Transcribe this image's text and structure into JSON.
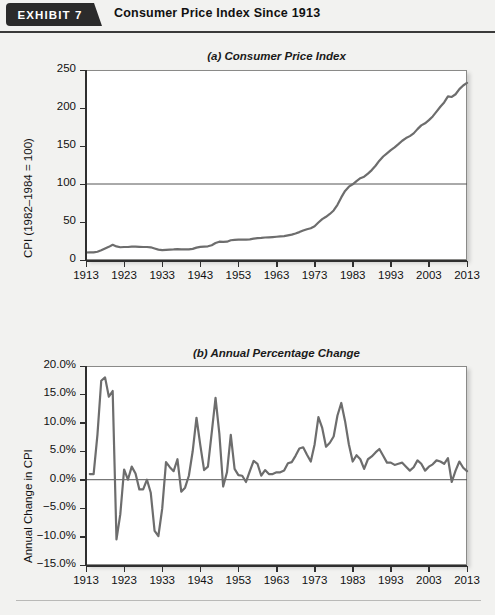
{
  "header": {
    "exhibit_tag": "EXHIBIT 7",
    "title": "Consumer Price Index Since 1913"
  },
  "chart_data": [
    {
      "type": "line",
      "panel_id": "a",
      "title": "(a) Consumer Price Index",
      "xlabel": "",
      "ylabel": "CPI (1982–1984 = 100)",
      "xlim": [
        1913,
        2013
      ],
      "ylim": [
        0,
        250
      ],
      "yticks": [
        0,
        50,
        100,
        150,
        200,
        250
      ],
      "ytick_labels": [
        "0",
        "50",
        "100",
        "150",
        "200",
        "250"
      ],
      "xticks": [
        1913,
        1923,
        1933,
        1943,
        1953,
        1963,
        1973,
        1983,
        1993,
        2003,
        2013
      ],
      "xtick_labels": [
        "1913",
        "1923",
        "1933",
        "1943",
        "1953",
        "1963",
        "1973",
        "1983",
        "1993",
        "2003",
        "2013"
      ],
      "grid": false,
      "reference_lines": [
        {
          "y": 100,
          "label": "100"
        }
      ],
      "legend": "none",
      "series": [
        {
          "name": "Consumer Price Index",
          "color": "#6d6d6d",
          "x": [
            1913,
            1914,
            1915,
            1916,
            1917,
            1918,
            1919,
            1920,
            1921,
            1922,
            1923,
            1924,
            1925,
            1926,
            1927,
            1928,
            1929,
            1930,
            1931,
            1932,
            1933,
            1934,
            1935,
            1936,
            1937,
            1938,
            1939,
            1940,
            1941,
            1942,
            1943,
            1944,
            1945,
            1946,
            1947,
            1948,
            1949,
            1950,
            1951,
            1952,
            1953,
            1954,
            1955,
            1956,
            1957,
            1958,
            1959,
            1960,
            1961,
            1962,
            1963,
            1964,
            1965,
            1966,
            1967,
            1968,
            1969,
            1970,
            1971,
            1972,
            1973,
            1974,
            1975,
            1976,
            1977,
            1978,
            1979,
            1980,
            1981,
            1982,
            1983,
            1984,
            1985,
            1986,
            1987,
            1988,
            1989,
            1990,
            1991,
            1992,
            1993,
            1994,
            1995,
            1996,
            1997,
            1998,
            1999,
            2000,
            2001,
            2002,
            2003,
            2004,
            2005,
            2006,
            2007,
            2008,
            2009,
            2010,
            2011,
            2012,
            2013
          ],
          "values": [
            9.9,
            10.0,
            10.1,
            10.9,
            12.8,
            15.1,
            17.3,
            20.0,
            17.9,
            16.8,
            17.1,
            17.1,
            17.5,
            17.7,
            17.4,
            17.1,
            17.1,
            16.7,
            15.2,
            13.7,
            13.0,
            13.4,
            13.7,
            13.9,
            14.4,
            14.1,
            13.9,
            14.0,
            14.7,
            16.3,
            17.3,
            17.6,
            18.0,
            19.5,
            22.3,
            24.1,
            23.8,
            24.1,
            26.0,
            26.5,
            26.7,
            26.9,
            26.8,
            27.2,
            28.1,
            28.9,
            29.1,
            29.6,
            29.9,
            30.2,
            30.6,
            31.0,
            31.5,
            32.4,
            33.4,
            34.8,
            36.7,
            38.8,
            40.5,
            41.8,
            44.4,
            49.3,
            53.8,
            56.9,
            60.6,
            65.2,
            72.6,
            82.4,
            90.9,
            96.5,
            99.6,
            103.9,
            107.6,
            109.6,
            113.6,
            118.3,
            124.0,
            130.7,
            136.2,
            140.3,
            144.5,
            148.2,
            152.4,
            156.9,
            160.5,
            163.0,
            166.6,
            172.2,
            177.1,
            179.9,
            184.0,
            188.9,
            195.3,
            201.6,
            207.3,
            215.3,
            214.5,
            218.1,
            224.9,
            229.6,
            233.0
          ]
        }
      ]
    },
    {
      "type": "line",
      "panel_id": "b",
      "title": "(b) Annual Percentage Change",
      "xlabel": "",
      "ylabel": "Annual Change in CPI",
      "xlim": [
        1913,
        2013
      ],
      "ylim": [
        -15,
        20
      ],
      "yticks": [
        -15,
        -10,
        -5,
        0,
        5,
        10,
        15,
        20
      ],
      "ytick_labels": [
        "−15.0%",
        "−10.0%",
        "−5.0%",
        "0.0%",
        "5.0%",
        "10.0%",
        "15.0%",
        "20.0%"
      ],
      "xticks": [
        1913,
        1923,
        1933,
        1943,
        1953,
        1963,
        1973,
        1983,
        1993,
        2003,
        2013
      ],
      "xtick_labels": [
        "1913",
        "1923",
        "1933",
        "1943",
        "1953",
        "1963",
        "1973",
        "1983",
        "1993",
        "2003",
        "2013"
      ],
      "grid": false,
      "reference_lines": [
        {
          "y": 0,
          "label": "0.0%"
        }
      ],
      "legend": "none",
      "series": [
        {
          "name": "Annual Change in CPI",
          "color": "#6d6d6d",
          "x": [
            1914,
            1915,
            1916,
            1917,
            1918,
            1919,
            1920,
            1921,
            1922,
            1923,
            1924,
            1925,
            1926,
            1927,
            1928,
            1929,
            1930,
            1931,
            1932,
            1933,
            1934,
            1935,
            1936,
            1937,
            1938,
            1939,
            1940,
            1941,
            1942,
            1943,
            1944,
            1945,
            1946,
            1947,
            1948,
            1949,
            1950,
            1951,
            1952,
            1953,
            1954,
            1955,
            1956,
            1957,
            1958,
            1959,
            1960,
            1961,
            1962,
            1963,
            1964,
            1965,
            1966,
            1967,
            1968,
            1969,
            1970,
            1971,
            1972,
            1973,
            1974,
            1975,
            1976,
            1977,
            1978,
            1979,
            1980,
            1981,
            1982,
            1983,
            1984,
            1985,
            1986,
            1987,
            1988,
            1989,
            1990,
            1991,
            1992,
            1993,
            1994,
            1995,
            1996,
            1997,
            1998,
            1999,
            2000,
            2001,
            2002,
            2003,
            2004,
            2005,
            2006,
            2007,
            2008,
            2009,
            2010,
            2011,
            2012,
            2013
          ],
          "values": [
            1.0,
            1.0,
            7.9,
            17.4,
            18.0,
            14.6,
            15.6,
            -10.5,
            -6.1,
            1.8,
            0.0,
            2.3,
            1.1,
            -1.7,
            -1.7,
            0.0,
            -2.3,
            -9.0,
            -9.9,
            -5.1,
            3.1,
            2.2,
            1.5,
            3.6,
            -2.1,
            -1.4,
            0.7,
            5.0,
            10.9,
            6.1,
            1.7,
            2.3,
            8.3,
            14.4,
            8.1,
            -1.2,
            1.3,
            7.9,
            1.9,
            0.8,
            0.7,
            -0.4,
            1.5,
            3.3,
            2.8,
            0.7,
            1.7,
            1.0,
            1.0,
            1.3,
            1.3,
            1.6,
            2.9,
            3.1,
            4.2,
            5.5,
            5.7,
            4.4,
            3.2,
            6.2,
            11.0,
            9.1,
            5.8,
            6.5,
            7.6,
            11.3,
            13.5,
            10.3,
            6.2,
            3.2,
            4.3,
            3.6,
            1.9,
            3.6,
            4.1,
            4.8,
            5.4,
            4.2,
            3.0,
            3.0,
            2.6,
            2.8,
            3.0,
            2.3,
            1.6,
            2.2,
            3.4,
            2.8,
            1.6,
            2.3,
            2.7,
            3.4,
            3.2,
            2.8,
            3.8,
            -0.4,
            1.6,
            3.2,
            2.1,
            1.5
          ]
        }
      ]
    }
  ]
}
